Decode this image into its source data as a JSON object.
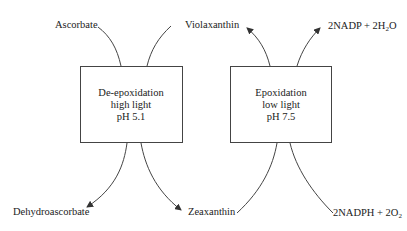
{
  "diagram": {
    "boxes": [
      {
        "id": "deepox",
        "lines": [
          "De-epoxidation",
          "high light",
          "pH 5.1"
        ]
      },
      {
        "id": "epox",
        "lines": [
          "Epoxidation",
          "low light",
          "pH 7.5"
        ]
      }
    ],
    "labels": {
      "ascorbate": "Ascorbate",
      "violaxanthin": "Violaxanthin",
      "nadp_h2o": "2NADP + 2H",
      "nadp_h2o_sub": "2",
      "nadp_h2o_tail": "O",
      "dehydroascorbate": "Dehydroascorbate",
      "zeaxanthin": "Zeaxanthin",
      "nadph_o2": "2NADPH + 2O",
      "nadph_o2_sub": "2"
    },
    "colors": {
      "stroke": "#444444",
      "text": "#222222",
      "background": "#ffffff"
    }
  }
}
